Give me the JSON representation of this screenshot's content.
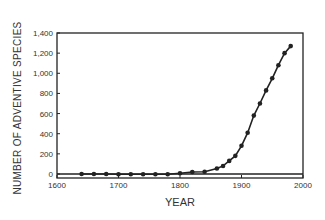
{
  "chart_data": {
    "type": "line",
    "title": "",
    "xlabel": "YEAR",
    "ylabel": "NUMBER OF ADVENTIVE SPECIES",
    "xlim": [
      1600,
      2000
    ],
    "ylim": [
      -50,
      1400
    ],
    "x_ticks": [
      1600,
      1700,
      1800,
      1900,
      2000
    ],
    "x_tick_labels": [
      "1600",
      "1700",
      "1800",
      "1900",
      "2000"
    ],
    "y_ticks": [
      0,
      200,
      400,
      600,
      800,
      1000,
      1200,
      1400
    ],
    "y_tick_labels": [
      "0",
      "200",
      "400",
      "600",
      "800",
      "1,000",
      "1,200",
      "1,400"
    ],
    "grid": false,
    "legend": null,
    "series": [
      {
        "name": "Adventive species",
        "marker": "circle",
        "x": [
          1640,
          1660,
          1680,
          1700,
          1720,
          1740,
          1760,
          1780,
          1800,
          1820,
          1840,
          1860,
          1870,
          1880,
          1890,
          1900,
          1910,
          1920,
          1930,
          1940,
          1950,
          1960,
          1970,
          1980
        ],
        "values": [
          0,
          0,
          0,
          -2,
          -2,
          -3,
          -3,
          -2,
          8,
          20,
          22,
          55,
          80,
          130,
          180,
          280,
          410,
          580,
          700,
          830,
          950,
          1080,
          1200,
          1270
        ]
      }
    ]
  }
}
